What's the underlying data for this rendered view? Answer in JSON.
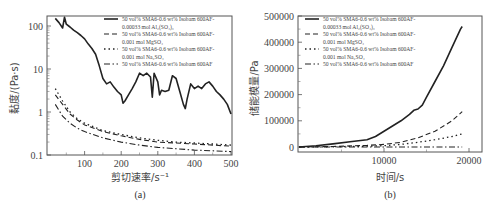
{
  "chart_data": [
    {
      "panel": "(a)",
      "type": "line",
      "xlabel": "剪切速率/s⁻¹",
      "ylabel": "黏度/(Pa·s)",
      "xscale": "linear",
      "yscale": "log",
      "xlim": [
        20,
        500
      ],
      "ylim": [
        0.1,
        180
      ],
      "xticks": [
        "100",
        "200",
        "300",
        "400",
        "500"
      ],
      "yticks": [
        "0.1",
        "1",
        "10",
        "100"
      ],
      "grid": false,
      "legend_position": "upper right",
      "series": [
        {
          "name": "50 vol% SMA6-0.6 wt% Isobam 600AF-0.00033 mol Al2(SO4)3",
          "style": "solid",
          "x": [
            20,
            30,
            40,
            45,
            50,
            60,
            70,
            80,
            90,
            100,
            110,
            120,
            130,
            140,
            150,
            160,
            170,
            180,
            190,
            200,
            205,
            210,
            220,
            230,
            240,
            250,
            260,
            270,
            280,
            285,
            290,
            300,
            305,
            310,
            320,
            330,
            340,
            350,
            360,
            370,
            375,
            380,
            390,
            400,
            410,
            420,
            430,
            440,
            450,
            460,
            470,
            480,
            490,
            500
          ],
          "values": [
            150,
            120,
            90,
            160,
            110,
            95,
            80,
            70,
            60,
            50,
            38,
            30,
            22,
            12,
            6,
            4.5,
            5,
            3.8,
            3,
            2.5,
            1.6,
            1.8,
            2.5,
            3.5,
            5,
            8,
            7,
            8,
            6.5,
            2.2,
            8,
            5,
            2.5,
            3.2,
            3.0,
            3.2,
            7,
            6,
            3,
            1.5,
            1.2,
            2,
            4.5,
            3.5,
            4,
            3.5,
            4.5,
            5,
            4,
            3,
            2.5,
            2,
            1.5,
            0.9
          ]
        },
        {
          "name": "50 vol% SMA6-0.6 wt% Isobam 600AF-0.001 mol MgSO4",
          "style": "dashed",
          "x": [
            20,
            40,
            60,
            80,
            100,
            150,
            200,
            250,
            300,
            350,
            400,
            450,
            500
          ],
          "values": [
            2.5,
            1.5,
            0.9,
            0.65,
            0.5,
            0.35,
            0.28,
            0.23,
            0.2,
            0.19,
            0.18,
            0.17,
            0.16
          ]
        },
        {
          "name": "50 vol% SMA6-0.6 wt% Isobam 600AF-0.001 mol Na2SO4",
          "style": "dotted",
          "x": [
            20,
            40,
            60,
            80,
            100,
            150,
            200,
            250,
            300,
            350,
            400,
            450,
            500
          ],
          "values": [
            3.5,
            1.8,
            1.0,
            0.7,
            0.55,
            0.37,
            0.3,
            0.25,
            0.22,
            0.2,
            0.19,
            0.18,
            0.17
          ]
        },
        {
          "name": "50 vol% SMA6-0.6 wt% Isobam 600AF",
          "style": "dash-dot",
          "x": [
            20,
            40,
            60,
            80,
            100,
            150,
            200,
            250,
            300,
            350,
            400,
            450,
            500
          ],
          "values": [
            1.5,
            0.8,
            0.55,
            0.42,
            0.35,
            0.25,
            0.2,
            0.17,
            0.15,
            0.14,
            0.13,
            0.125,
            0.12
          ]
        }
      ]
    },
    {
      "panel": "(b)",
      "type": "line",
      "xlabel": "时间/s",
      "ylabel": "储能模量/Pa",
      "xscale": "linear",
      "yscale": "linear",
      "xlim": [
        0,
        21500
      ],
      "ylim": [
        -20000,
        500000
      ],
      "xticks": [
        "10000",
        "20000"
      ],
      "yticks": [
        "0",
        "100000",
        "200000",
        "300000",
        "400000",
        "500000"
      ],
      "grid": false,
      "legend_position": "upper left",
      "series": [
        {
          "name": "50 vol% SMA6-0.6 wt% Isobam 600AF-0.00033 mol Al2(SO4)3",
          "style": "solid",
          "x": [
            0,
            2000,
            4000,
            6000,
            8000,
            9000,
            10000,
            11000,
            12000,
            13000,
            13500,
            14000,
            14500,
            15000,
            16000,
            17000,
            18000,
            19000,
            19200
          ],
          "values": [
            0,
            5000,
            12000,
            20000,
            28000,
            40000,
            60000,
            80000,
            100000,
            125000,
            140000,
            145000,
            160000,
            190000,
            250000,
            310000,
            380000,
            450000,
            460000
          ]
        },
        {
          "name": "50 vol% SMA6-0.6 wt% Isobam 600AF-0.001 mol MgSO4",
          "style": "dashed",
          "x": [
            0,
            4000,
            8000,
            10000,
            12000,
            14000,
            16000,
            18000,
            19200
          ],
          "values": [
            0,
            2000,
            6000,
            10000,
            18000,
            35000,
            60000,
            100000,
            135000
          ]
        },
        {
          "name": "50 vol% SMA6-0.6 wt% Isobam 600AF-0.001 mol Na2SO4",
          "style": "dotted",
          "x": [
            0,
            4000,
            8000,
            10000,
            12000,
            14000,
            16000,
            18000,
            19200
          ],
          "values": [
            0,
            1000,
            3000,
            5000,
            10000,
            18000,
            28000,
            40000,
            50000
          ]
        },
        {
          "name": "50 vol% SMA6-0.6 wt% Isobam 600AF",
          "style": "dash-dot",
          "x": [
            0,
            4000,
            8000,
            12000,
            16000,
            19200
          ],
          "values": [
            0,
            0,
            0,
            0,
            0,
            0
          ]
        }
      ]
    }
  ],
  "panels": {
    "a": {
      "caption": "(a)",
      "xlabel": "剪切速率/s⁻¹",
      "ylabel": "黏度/(Pa·s)",
      "xticks": [
        "100",
        "200",
        "300",
        "400",
        "500"
      ],
      "yticks": [
        "0.1",
        "1",
        "10",
        "100"
      ],
      "legend": [
        {
          "line1": "50 vol% SMA6-0.6 wt% Isobam 600AF-",
          "line2": "0.00033 mol Al₂(SO₄)₃"
        },
        {
          "line1": "50 vol% SMA6-0.6 wt% Isobam 600AF-",
          "line2": "0.001 mol MgSO₄"
        },
        {
          "line1": "50 vol% SMA6-0.6 wt% Isobam 600AF-",
          "line2": "0.001 mol Na₂SO₄"
        },
        {
          "line1": "50 vol% SMA6-0.6 wt% Isobam 600AF",
          "line2": ""
        }
      ]
    },
    "b": {
      "caption": "(b)",
      "xlabel": "时间/s",
      "ylabel": "储能模量/Pa",
      "xticks": [
        "10000",
        "20000"
      ],
      "yticks": [
        "0",
        "100000",
        "200000",
        "300000",
        "400000",
        "500000"
      ],
      "legend": [
        {
          "line1": "50 vol% SMA6-0.6 wt% Isobam 600AF-",
          "line2": "0.00033 mol Al₂(SO₄)₃"
        },
        {
          "line1": "50 vol% SMA6-0.6 wt% Isobam 600AF-",
          "line2": "0.001 mol MgSO₄"
        },
        {
          "line1": "50 vol% SMA6-0.6 wt% Isobam 600AF-",
          "line2": "0.001 mol Na₂SO₄"
        },
        {
          "line1": "50 vol% SMA6-0.6 wt% Isobam 600AF",
          "line2": ""
        }
      ]
    }
  }
}
